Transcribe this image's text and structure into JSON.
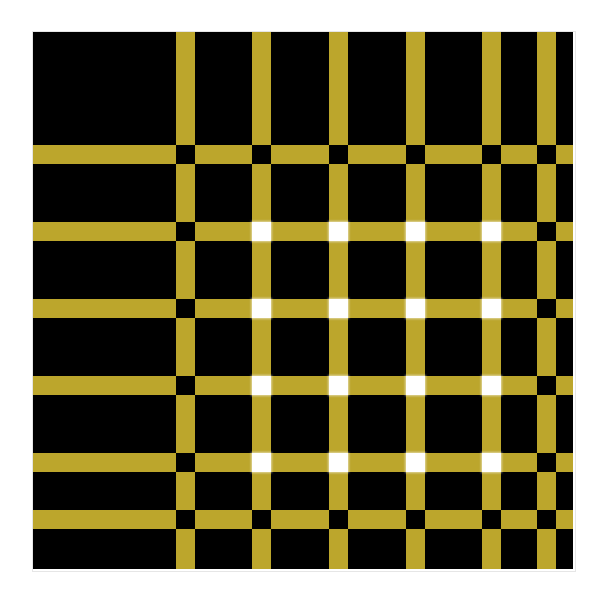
{
  "figure": {
    "kind": "optical-illusion-figure",
    "canvas": {
      "width": 606,
      "height": 600,
      "background": "#ffffff"
    }
  },
  "illusion": {
    "panel": {
      "x": 33,
      "y": 32,
      "width": 540,
      "height": 537,
      "background_color": "#000000"
    },
    "bar_color": "#bca62c",
    "background_color": "#000000",
    "node_black_color": "#000000",
    "node_white_color": "#ffffff",
    "bar_thickness": 19,
    "node_size": 19,
    "columns": 6,
    "rows": 6,
    "vertical_bar_x": [
      152,
      228,
      305,
      382,
      458,
      513
    ],
    "horizontal_bar_y": [
      122,
      199,
      276,
      353,
      430,
      487
    ],
    "node_grid": [
      [
        "black",
        "black",
        "black",
        "black",
        "black",
        "black"
      ],
      [
        "black",
        "white",
        "white",
        "white",
        "white",
        "black"
      ],
      [
        "black",
        "white",
        "white",
        "white",
        "white",
        "black"
      ],
      [
        "black",
        "white",
        "white",
        "white",
        "white",
        "black"
      ],
      [
        "black",
        "white",
        "white",
        "white",
        "white",
        "black"
      ],
      [
        "black",
        "black",
        "black",
        "black",
        "black",
        "black"
      ]
    ]
  }
}
